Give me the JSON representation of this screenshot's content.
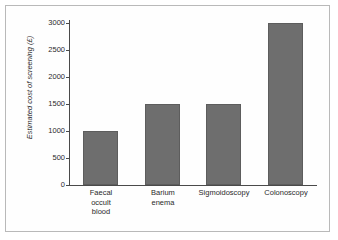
{
  "chart_data": {
    "type": "bar",
    "title": "",
    "xlabel": "",
    "ylabel": "Estimated cost of screening (£)",
    "categories": [
      "Faecal occult blood",
      "Barium enema",
      "Sigmoidoscopy",
      "Colonoscopy"
    ],
    "category_lines": [
      [
        "Faecal",
        "occult",
        "blood"
      ],
      [
        "Barium",
        "enema"
      ],
      [
        "Sigmoidoscopy"
      ],
      [
        "Colonoscopy"
      ]
    ],
    "values": [
      1000,
      1500,
      1500,
      3000
    ],
    "ylim": [
      0,
      3000
    ],
    "yticks": [
      0,
      500,
      1000,
      1500,
      2000,
      2500,
      3000
    ],
    "ytick_labels": [
      "0",
      "500",
      "1000",
      "1500",
      "2000",
      "2500",
      "3000"
    ],
    "grid": false,
    "legend": null,
    "bar_color": "#6e6e6e",
    "axis_color": "#4a4a4a",
    "background": "#ffffff",
    "frame_border_color": "#b9b9b9"
  }
}
